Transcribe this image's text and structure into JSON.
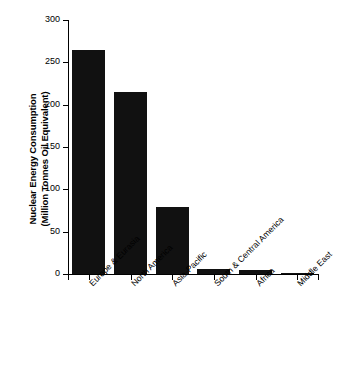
{
  "chart_data": {
    "type": "bar",
    "title": "",
    "xlabel": "",
    "ylabel": "Nuclear Energy Consumption (Million Tonnes Oil Equivalent)",
    "ylabel_line1": "Nuclear Energy Consumption",
    "ylabel_line2": "(Million Tonnes Oil Equivalent)",
    "categories": [
      "Europe & Eurasia",
      "North America",
      "Asia-Pacific",
      "South & Central America",
      "Africa",
      "Middle East"
    ],
    "values": [
      264,
      215,
      79,
      6,
      5,
      1
    ],
    "ylim": [
      0,
      300
    ],
    "yticks": [
      0,
      50,
      100,
      150,
      200,
      250,
      300
    ],
    "ytick_labels": [
      "0",
      "50",
      "100",
      "150",
      "200",
      "250",
      "300"
    ],
    "grid": false,
    "legend": false,
    "bar_color": "#111111",
    "axis_color": "#000000",
    "background_color": "#ffffff"
  }
}
